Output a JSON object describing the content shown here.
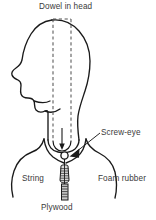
{
  "figure": {
    "type": "technical-line-drawing",
    "width": 156,
    "height": 220,
    "background_color": "#ffffff",
    "line_color": "#1a1a1a",
    "text_color": "#3a3a3a",
    "labels": {
      "dowel": "Dowel in head",
      "screw_eye": "Screw-eye",
      "string": "String",
      "foam_rubber": "Foam rubber",
      "plywood": "Plywood"
    },
    "parts": [
      {
        "name": "head-profile",
        "style": "solid-outline",
        "description": "human head in left-facing profile"
      },
      {
        "name": "dowel",
        "style": "dashed-outline",
        "description": "vertical dowel rod inside head, open top, rounded bottom tip"
      },
      {
        "name": "screw-eye",
        "style": "small-circle",
        "description": "ring fastener at base of dowel"
      },
      {
        "name": "foam-rubber",
        "style": "solid-outline",
        "description": "curved block with V notch supporting the neck"
      },
      {
        "name": "string",
        "style": "hatched-cylinder",
        "description": "bound cord below screw-eye"
      },
      {
        "name": "plywood",
        "style": "hatched-strip",
        "description": "base board strip at bottom"
      },
      {
        "name": "leader-line-screw-eye",
        "style": "arrow",
        "description": "pointer from Screw-eye label to the ring"
      },
      {
        "name": "arrow-dowel-tip",
        "style": "arrow",
        "description": "downward arrow along dowel axis"
      }
    ]
  }
}
